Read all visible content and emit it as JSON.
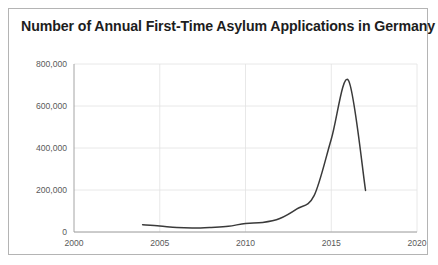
{
  "card": {
    "title": "Number of Annual First-Time Asylum Applications in Germany"
  },
  "chart_data": {
    "type": "line",
    "title": "Number of Annual First-Time Asylum Applications in Germany",
    "xlabel": "",
    "ylabel": "",
    "xlim": [
      2000,
      2020
    ],
    "ylim": [
      0,
      800000
    ],
    "x_ticks": [
      "2000",
      "2005",
      "2010",
      "2015",
      "2020"
    ],
    "x_tick_values": [
      2000,
      2005,
      2010,
      2015,
      2020
    ],
    "y_ticks": [
      "0",
      "200,000",
      "400,000",
      "600,000",
      "800,000"
    ],
    "y_tick_values": [
      0,
      200000,
      400000,
      600000,
      800000
    ],
    "grid": true,
    "legend": "none",
    "series": [
      {
        "name": "First-time asylum applications",
        "color": "#3a3a3a",
        "x": [
          2004,
          2005,
          2006,
          2007,
          2008,
          2009,
          2010,
          2011,
          2012,
          2013,
          2014,
          2015,
          2016,
          2017
        ],
        "values": [
          35000,
          29000,
          21000,
          19000,
          22000,
          27000,
          41000,
          45000,
          64000,
          110000,
          173000,
          442000,
          722000,
          198000
        ]
      }
    ]
  }
}
